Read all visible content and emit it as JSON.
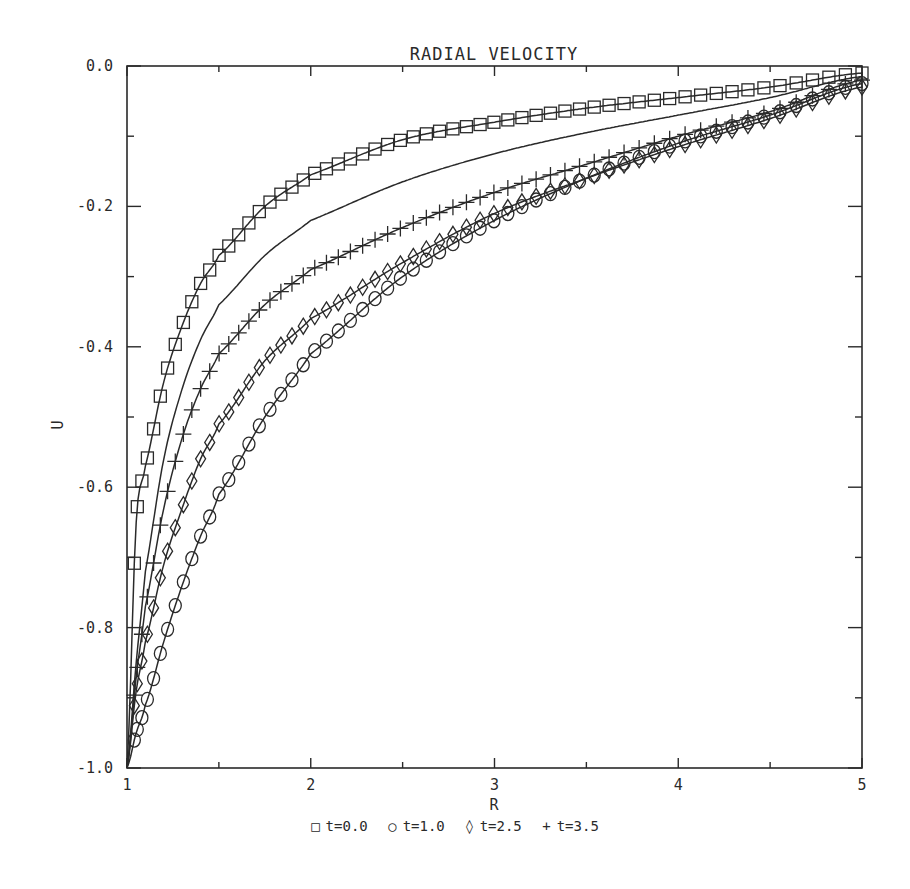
{
  "chart_data": {
    "type": "line",
    "title": "RADIAL VELOCITY",
    "xlabel": "R",
    "ylabel": "U",
    "xlim": [
      1,
      5
    ],
    "ylim": [
      -1.0,
      0.0
    ],
    "x_ticks": [
      "1",
      "2",
      "3",
      "4",
      "5"
    ],
    "y_ticks": [
      "0.0",
      "-0.2",
      "-0.4",
      "-0.6",
      "-0.8",
      "-1.0"
    ],
    "grid": false,
    "legend_position": "bottom",
    "x": [
      1.0,
      1.05,
      1.1,
      1.2,
      1.3,
      1.4,
      1.5,
      1.75,
      2.0,
      2.5,
      3.0,
      3.5,
      4.0,
      4.5,
      5.0
    ],
    "series": [
      {
        "name": "t=0.0",
        "marker": "square",
        "values": [
          -1.0,
          -0.65,
          -0.57,
          -0.45,
          -0.37,
          -0.31,
          -0.27,
          -0.2,
          -0.155,
          -0.105,
          -0.08,
          -0.06,
          -0.045,
          -0.03,
          -0.01
        ]
      },
      {
        "name": "t=1.0",
        "marker": "circle",
        "values": [
          -1.0,
          -0.95,
          -0.91,
          -0.82,
          -0.74,
          -0.67,
          -0.61,
          -0.5,
          -0.41,
          -0.3,
          -0.22,
          -0.16,
          -0.11,
          -0.07,
          -0.025
        ]
      },
      {
        "name": "t=2.5",
        "marker": "diamond",
        "values": [
          -1.0,
          -0.89,
          -0.82,
          -0.71,
          -0.63,
          -0.56,
          -0.51,
          -0.42,
          -0.36,
          -0.28,
          -0.21,
          -0.16,
          -0.115,
          -0.075,
          -0.03
        ]
      },
      {
        "name": "t=3.5",
        "marker": "plus",
        "values": [
          -1.0,
          -0.87,
          -0.77,
          -0.63,
          -0.53,
          -0.46,
          -0.41,
          -0.34,
          -0.29,
          -0.23,
          -0.18,
          -0.14,
          -0.1,
          -0.065,
          -0.02
        ]
      },
      {
        "name": "(unmarked curve)",
        "marker": "none",
        "values": [
          -1.0,
          -0.85,
          -0.72,
          -0.56,
          -0.46,
          -0.39,
          -0.34,
          -0.27,
          -0.22,
          -0.165,
          -0.125,
          -0.095,
          -0.07,
          -0.045,
          -0.015
        ]
      }
    ]
  },
  "legend": {
    "items": [
      {
        "symbol": "□",
        "label": "t=0.0"
      },
      {
        "symbol": "○",
        "label": "t=1.0"
      },
      {
        "symbol": "◊",
        "label": "t=2.5"
      },
      {
        "symbol": "+",
        "label": "t=3.5"
      }
    ]
  }
}
